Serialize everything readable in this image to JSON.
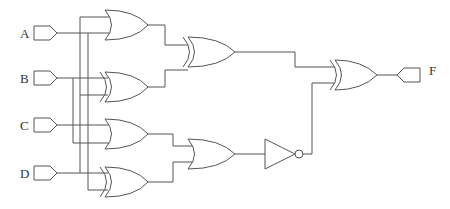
{
  "diagram": {
    "type": "logic-circuit",
    "inputs": [
      {
        "id": "A",
        "label": "A"
      },
      {
        "id": "B",
        "label": "B"
      },
      {
        "id": "C",
        "label": "C"
      },
      {
        "id": "D",
        "label": "D"
      }
    ],
    "outputs": [
      {
        "id": "F",
        "label": "F"
      }
    ],
    "gates": [
      {
        "id": "g1",
        "type": "OR",
        "inputs": [
          "A",
          "A"
        ]
      },
      {
        "id": "g2",
        "type": "XOR",
        "inputs": [
          "B",
          "A"
        ]
      },
      {
        "id": "g3",
        "type": "OR",
        "inputs": [
          "C",
          "B"
        ]
      },
      {
        "id": "g4",
        "type": "XOR",
        "inputs": [
          "D",
          "A"
        ]
      },
      {
        "id": "g5",
        "type": "XOR",
        "inputs": [
          "g1",
          "g2"
        ]
      },
      {
        "id": "g6",
        "type": "OR",
        "inputs": [
          "g3",
          "g4"
        ]
      },
      {
        "id": "g7",
        "type": "NOT",
        "inputs": [
          "g6"
        ]
      },
      {
        "id": "g8",
        "type": "XOR",
        "inputs": [
          "g5",
          "g7"
        ],
        "output": "F"
      }
    ],
    "colors": {
      "line": "#555555",
      "background": "#ffffff"
    }
  }
}
